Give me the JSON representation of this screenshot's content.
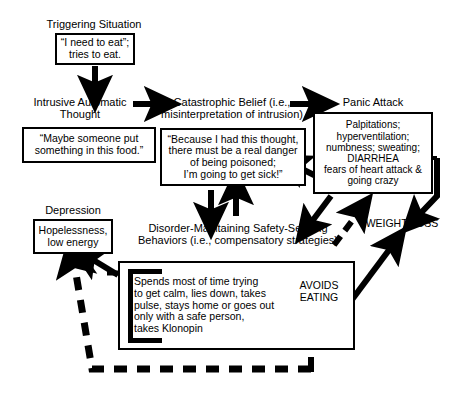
{
  "diagram": {
    "nodes": {
      "triggering_situation_label": "Triggering Situation",
      "triggering_situation_box": "“I need to eat”;\ntries to eat.",
      "intrusive_thought_label": "Intrusive Automatic\nThought",
      "intrusive_thought_box": "“Maybe someone put\nsomething in this food.”",
      "catastrophic_belief_label": "Catastrophic Belief (i.e.,\nmisinterpretation of intrusion)",
      "catastrophic_belief_box": "“Because I had this thought,\nthere must be a real danger\nof being poisoned;\nI’m going to get sick!”",
      "panic_attack_label": "Panic Attack",
      "panic_attack_symptoms_top": "Palpitations;\nhyperventilation;\nnumbness; sweating;",
      "panic_attack_diarrhea": "DIARRHEA",
      "panic_attack_symptoms_bottom": "fears of heart attack &\ngoing crazy",
      "depression_label": "Depression",
      "depression_box": "Hopelessness,\nlow energy",
      "safety_behaviors_label": "Disorder-Maintaining Safety-Seeking\nBehaviors (i.e., compensatory strategies)",
      "safety_behaviors_box": "Spends most of time trying\nto get calm, lies down, takes\npulse, stays home or goes out\nonly with a safe person,\ntakes Klonopin",
      "avoids_eating_label": "AVOIDS\nEATING",
      "weight_loss_label": "WEIGHT LOSS"
    },
    "colors": {
      "ink": "#000000",
      "paper": "#ffffff"
    }
  }
}
